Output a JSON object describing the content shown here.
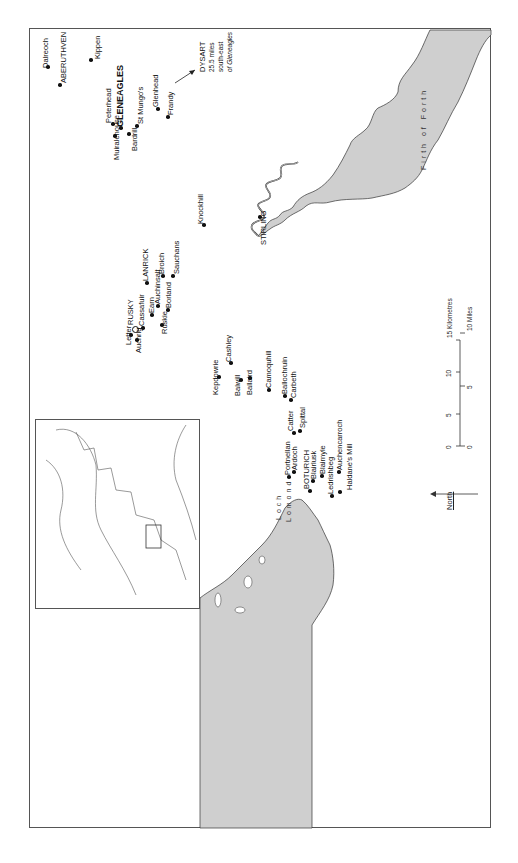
{
  "map": {
    "places": [
      {
        "name": "Dalreoch",
        "x": 48,
        "y": 67,
        "lx": 41,
        "ly": 68,
        "cls": ""
      },
      {
        "name": "ABERUTHVEN",
        "x": 60,
        "y": 85,
        "lx": 59,
        "ly": 83,
        "cls": "caps"
      },
      {
        "name": "Kippen",
        "x": 91,
        "y": 60,
        "lx": 93,
        "ly": 59,
        "cls": ""
      },
      {
        "name": "Peterhead",
        "x": 113,
        "y": 124,
        "lx": 104,
        "ly": 123,
        "cls": ""
      },
      {
        "name": "GLENEAGLES",
        "x": 121,
        "y": 128,
        "lx": 115,
        "ly": 127,
        "cls": "big"
      },
      {
        "name": "Muiralehouse",
        "x": 115,
        "y": 136,
        "lx": 112,
        "ly": 160,
        "cls": ""
      },
      {
        "name": "Bardrill",
        "x": 129,
        "y": 134,
        "lx": 130,
        "ly": 151,
        "cls": ""
      },
      {
        "name": "St Mungo's",
        "x": 137,
        "y": 126,
        "lx": 136,
        "ly": 124,
        "cls": ""
      },
      {
        "name": "Glenhead",
        "x": 158,
        "y": 109,
        "lx": 151,
        "ly": 107,
        "cls": ""
      },
      {
        "name": "Frandy",
        "x": 168,
        "y": 117,
        "lx": 166,
        "ly": 115,
        "cls": ""
      },
      {
        "name": "Knockhill",
        "x": 204,
        "y": 225,
        "lx": 196,
        "ly": 224,
        "cls": ""
      },
      {
        "name": "STIRLING",
        "x": 260,
        "y": 217,
        "lx": 259,
        "ly": 245,
        "cls": "caps"
      },
      {
        "name": "LANRICK",
        "x": 147,
        "y": 283,
        "lx": 141,
        "ly": 281,
        "cls": "caps"
      },
      {
        "name": "Broich",
        "x": 163,
        "y": 276,
        "lx": 157,
        "ly": 274,
        "cls": ""
      },
      {
        "name": "Sauchans",
        "x": 173,
        "y": 276,
        "lx": 172,
        "ly": 274,
        "cls": ""
      },
      {
        "name": "Auchinsalt",
        "x": 158,
        "y": 306,
        "lx": 153,
        "ly": 304,
        "cls": ""
      },
      {
        "name": "Borland",
        "x": 168,
        "y": 310,
        "lx": 164,
        "ly": 308,
        "cls": ""
      },
      {
        "name": "Earn",
        "x": 152,
        "y": 315,
        "lx": 147,
        "ly": 313,
        "cls": ""
      },
      {
        "name": "RUSKY",
        "x": 134,
        "y": 328,
        "lx": 126,
        "ly": 325,
        "cls": "caps"
      },
      {
        "name": "Cassafuir",
        "x": 143,
        "y": 328,
        "lx": 137,
        "ly": 326,
        "cls": ""
      },
      {
        "name": "Ruskie",
        "x": 162,
        "y": 325,
        "lx": 160,
        "ly": 334,
        "cls": ""
      },
      {
        "name": "Letter",
        "x": 131,
        "y": 335,
        "lx": 124,
        "ly": 345,
        "cls": ""
      },
      {
        "name": "Auchrig",
        "x": 137,
        "y": 340,
        "lx": 134,
        "ly": 353,
        "cls": ""
      },
      {
        "name": "Cashley",
        "x": 231,
        "y": 363,
        "lx": 224,
        "ly": 362,
        "cls": ""
      },
      {
        "name": "Kepdowrie",
        "x": 219,
        "y": 377,
        "lx": 211,
        "ly": 395,
        "cls": ""
      },
      {
        "name": "Balwill",
        "x": 241,
        "y": 380,
        "lx": 233,
        "ly": 396,
        "cls": ""
      },
      {
        "name": "Ballaird",
        "x": 250,
        "y": 378,
        "lx": 245,
        "ly": 395,
        "cls": ""
      },
      {
        "name": "Camoquhill",
        "x": 269,
        "y": 390,
        "lx": 264,
        "ly": 388,
        "cls": ""
      },
      {
        "name": "Ballochruin",
        "x": 285,
        "y": 396,
        "lx": 280,
        "ly": 394,
        "cls": ""
      },
      {
        "name": "Carbeth",
        "x": 291,
        "y": 400,
        "lx": 289,
        "ly": 398,
        "cls": ""
      },
      {
        "name": "Catter",
        "x": 294,
        "y": 433,
        "lx": 286,
        "ly": 431,
        "cls": ""
      },
      {
        "name": "Spittal",
        "x": 300,
        "y": 431,
        "lx": 298,
        "ly": 428,
        "cls": ""
      },
      {
        "name": "Portnellan",
        "x": 289,
        "y": 477,
        "lx": 283,
        "ly": 475,
        "cls": ""
      },
      {
        "name": "Ardoch",
        "x": 294,
        "y": 472,
        "lx": 290,
        "ly": 470,
        "cls": ""
      },
      {
        "name": "BOTURICH",
        "x": 310,
        "y": 491,
        "lx": 302,
        "ly": 489,
        "cls": "caps"
      },
      {
        "name": "Blairlusk",
        "x": 313,
        "y": 481,
        "lx": 309,
        "ly": 479,
        "cls": ""
      },
      {
        "name": "Blairnyle",
        "x": 322,
        "y": 476,
        "lx": 318,
        "ly": 474,
        "cls": ""
      },
      {
        "name": "Ledrishbeg",
        "x": 332,
        "y": 496,
        "lx": 326,
        "ly": 494,
        "cls": ""
      },
      {
        "name": "Auchencarroch",
        "x": 339,
        "y": 472,
        "lx": 335,
        "ly": 470,
        "cls": ""
      },
      {
        "name": "Haldane's Mill",
        "x": 340,
        "y": 492,
        "lx": 345,
        "ly": 490,
        "cls": ""
      }
    ],
    "rusky_symbol": "castle-ring",
    "dysart_note": {
      "line1": "DYSART",
      "line2": "25.5 miles",
      "line3": "south-east",
      "line4": "of Gleneagles"
    },
    "water_labels": {
      "firth": "Firth of Forth",
      "loch1": "Loch",
      "loch2": "Lomond"
    },
    "scale": {
      "km_label": "15 Kilometres",
      "mi_label": "10 Miles",
      "km_ticks": [
        "0",
        "5",
        "10",
        "15"
      ],
      "mi_ticks": [
        "0",
        "5",
        "10"
      ]
    },
    "north_label": "North",
    "colors": {
      "water": "#cfcfcf",
      "line": "#333333",
      "frame": "#555555"
    }
  }
}
